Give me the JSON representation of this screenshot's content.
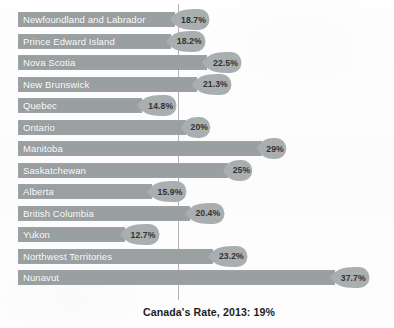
{
  "chart_data": {
    "type": "bar",
    "orientation": "horizontal",
    "title": "",
    "subtitle": "",
    "xlabel": "",
    "ylabel": "",
    "categories": [
      "Newfoundland and Labrador",
      "Prince Edward Island",
      "Nova Scotia",
      "New Brunswick",
      "Quebec",
      "Ontario",
      "Manitoba",
      "Saskatchewan",
      "Alberta",
      "British Columbia",
      "Yukon",
      "Northwest Territories",
      "Nunavut"
    ],
    "values": [
      18.7,
      18.2,
      22.5,
      21.3,
      14.8,
      20,
      29,
      25,
      15.9,
      20.4,
      12.7,
      23.2,
      37.7
    ],
    "data_labels": [
      "18.7%",
      "18.2%",
      "22.5%",
      "21.3%",
      "14.8%",
      "20%",
      "29%",
      "25%",
      "15.9%",
      "20.4%",
      "12.7%",
      "23.2%",
      "37.7%"
    ],
    "xlim": [
      0,
      40
    ],
    "grid": false,
    "legend": "none",
    "reference_line": {
      "value": 19,
      "label": "Canada's Rate, 2013: 19%"
    },
    "colors": {
      "bar": "#9a9fa1",
      "bar_label_text": "#ffffff",
      "callout_fill": "#a9aeb0",
      "callout_text": "#333333",
      "reference_line": "#b9b0b4",
      "caption_text": "#1c1c1c",
      "background": "#fdfdfd"
    }
  },
  "caption": {
    "text": "Canada's Rate, 2013: 19%"
  }
}
